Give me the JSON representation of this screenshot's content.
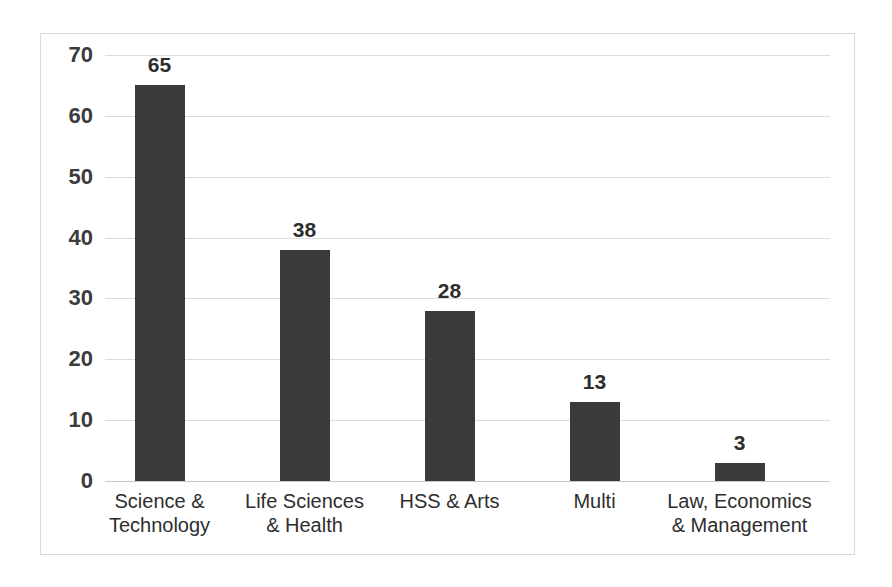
{
  "chart_data": {
    "type": "bar",
    "title": "",
    "subtitle": "",
    "xlabel": "",
    "ylabel": "",
    "categories": [
      "Science &\nTechnology",
      "Life Sciences\n& Health",
      "HSS & Arts",
      "Multi",
      "Law, Economics\n& Management"
    ],
    "values": [
      65,
      38,
      28,
      13,
      3
    ],
    "value_labels": [
      "65",
      "38",
      "28",
      "13",
      "3"
    ],
    "ylim": [
      0,
      70
    ],
    "ytick_values": [
      0,
      10,
      20,
      30,
      40,
      50,
      60,
      70
    ],
    "ytick_labels": [
      "0",
      "10",
      "20",
      "30",
      "40",
      "50",
      "60",
      "70"
    ],
    "grid": true,
    "legend": false,
    "legend_position": "none",
    "series": [
      {
        "name": "Count",
        "values": [
          65,
          38,
          28,
          13,
          3
        ]
      }
    ],
    "colors": {
      "bar": "#3a3a3a",
      "gridline": "#dcdcdc",
      "baseline": "#c8c8c8",
      "frame_border": "#d9d9d9",
      "tick_label": "#3c3c3c",
      "data_label": "#2e2e2e",
      "category_label": "#2e2e2e",
      "background": "#ffffff"
    }
  }
}
